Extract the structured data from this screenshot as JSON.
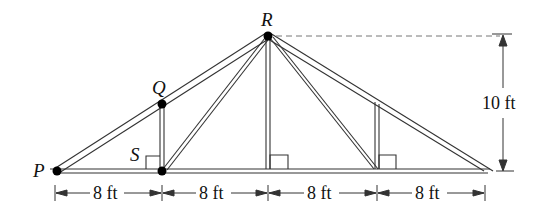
{
  "diagram": {
    "type": "roof-truss",
    "points": {
      "P": {
        "label": "P"
      },
      "Q": {
        "label": "Q"
      },
      "R": {
        "label": "R"
      },
      "S": {
        "label": "S"
      }
    },
    "dimensions": {
      "spans": [
        "8 ft",
        "8 ft",
        "8 ft",
        "8 ft"
      ],
      "height": "10 ft"
    },
    "right_angle_marks": 3,
    "colors": {
      "stroke": "#222222",
      "background": "#ffffff"
    }
  }
}
